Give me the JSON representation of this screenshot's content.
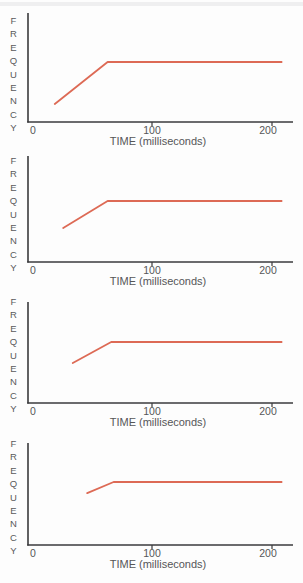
{
  "page": {
    "background": "#fdfdfd",
    "description_colors": {
      "line": "#dd6a55",
      "axis": "#3a3a3c",
      "text": "#565658"
    }
  },
  "chart_data": [
    {
      "type": "line",
      "title": "",
      "xlabel": "TIME (milliseconds)",
      "ylabel": "FREQUENCY",
      "x_tick_labels": [
        "0",
        "100",
        "200"
      ],
      "x_ticks_ms": [
        0,
        100,
        200
      ],
      "x_range_ms": [
        0,
        218
      ],
      "y_axis_numeric": false,
      "grid": false,
      "legend": "none",
      "series": [
        {
          "name": "frequency-trajectory",
          "shape": "rising transition then steady state",
          "color": "#dd6a55",
          "points_ms_relfreq": [
            [
              19,
              0.167
            ],
            [
              63,
              0.556
            ],
            [
              208,
              0.556
            ]
          ]
        }
      ]
    },
    {
      "type": "line",
      "title": "",
      "xlabel": "TIME (milliseconds)",
      "ylabel": "FREQUENCY",
      "x_tick_labels": [
        "0",
        "100",
        "200"
      ],
      "x_ticks_ms": [
        0,
        100,
        200
      ],
      "x_range_ms": [
        0,
        218
      ],
      "y_axis_numeric": false,
      "grid": false,
      "legend": "none",
      "series": [
        {
          "name": "frequency-trajectory",
          "shape": "rising transition then steady state",
          "color": "#dd6a55",
          "points_ms_relfreq": [
            [
              26,
              0.315
            ],
            [
              63,
              0.565
            ],
            [
              208,
              0.565
            ]
          ]
        }
      ]
    },
    {
      "type": "line",
      "title": "",
      "xlabel": "TIME (milliseconds)",
      "ylabel": "FREQUENCY",
      "x_tick_labels": [
        "0",
        "100",
        "200"
      ],
      "x_ticks_ms": [
        0,
        100,
        200
      ],
      "x_range_ms": [
        0,
        218
      ],
      "y_axis_numeric": false,
      "grid": false,
      "legend": "none",
      "series": [
        {
          "name": "frequency-trajectory",
          "shape": "rising transition then steady state",
          "color": "#dd6a55",
          "points_ms_relfreq": [
            [
              34,
              0.37
            ],
            [
              66,
              0.565
            ],
            [
              208,
              0.565
            ]
          ]
        }
      ]
    },
    {
      "type": "line",
      "title": "",
      "xlabel": "TIME (milliseconds)",
      "ylabel": "FREQUENCY",
      "x_tick_labels": [
        "0",
        "100",
        "200"
      ],
      "x_ticks_ms": [
        0,
        100,
        200
      ],
      "x_range_ms": [
        0,
        218
      ],
      "y_axis_numeric": false,
      "grid": false,
      "legend": "none",
      "series": [
        {
          "name": "frequency-trajectory",
          "shape": "rising transition then steady state",
          "color": "#dd6a55",
          "points_ms_relfreq": [
            [
              46,
              0.481
            ],
            [
              68,
              0.583
            ],
            [
              208,
              0.583
            ]
          ]
        }
      ]
    }
  ]
}
